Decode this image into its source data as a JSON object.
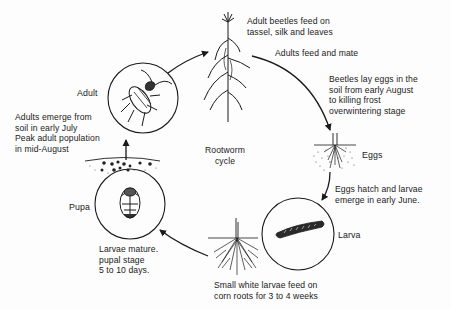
{
  "title": "Rootworm cycle",
  "stages": {
    "adult": {
      "name": "Adult",
      "icon": "beetle-icon"
    },
    "eggs": {
      "name": "Eggs",
      "icon": "eggs-in-soil-icon"
    },
    "larva": {
      "name": "Larva",
      "icon": "larva-icon"
    },
    "pupa": {
      "name": "Pupa",
      "icon": "pupa-icon"
    }
  },
  "annotations": {
    "corn_feeding": "Adult beetles feed on\ntassel, silk and leaves",
    "feed_mate": "Adults feed and mate",
    "lay_eggs": "Beetles lay eggs in the\nsoil from early August\nto killing frost\noverwintering stage",
    "hatch": "Eggs hatch and larvae\nemerge in early June.",
    "root_feeding": "Small white larvae feed on\ncorn roots for 3 to 4 weeks",
    "pupation": "Larvae mature.\npupal stage\n5 to 10 days.",
    "emergence": "Adults emerge from\nsoil in early July\nPeak adult population\nin mid-August"
  },
  "center_label": "Rootworm\ncycle",
  "colors": {
    "ink": "#1a1a1a",
    "background": "#fdfdfd"
  }
}
